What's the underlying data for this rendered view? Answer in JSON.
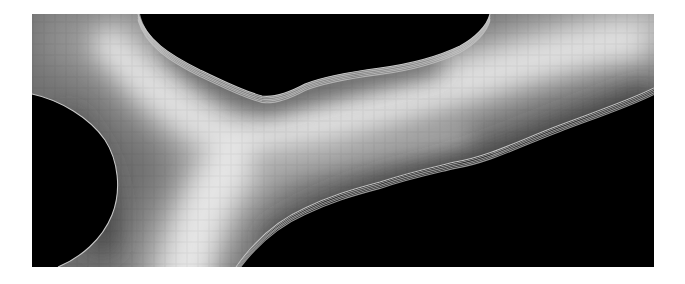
{
  "figure": {
    "background": "#ffffff",
    "panel": {
      "x": 32,
      "y": 14,
      "width": 622,
      "height": 253
    },
    "colors": {
      "dark_region": "#000000",
      "bright_core": "#dedede",
      "mid_gray": "#8a8a8a",
      "contour": "#c8c8c8"
    },
    "dark_regions": [
      {
        "name": "top-center-void",
        "path": "M140,14 C146,40 170,55 200,70 C222,80 240,90 262,96 C275,98 290,92 305,84 C325,76 350,72 380,68 C410,64 435,58 460,46 C475,38 487,26 490,14 Z"
      },
      {
        "name": "left-void",
        "path": "M32,94 C60,100 90,118 105,140 C118,160 122,190 112,215 C102,240 80,258 58,267 L32,267 Z"
      },
      {
        "name": "bottom-right-void",
        "path": "M236,267 C255,240 278,220 305,208 C330,196 350,190 380,182 C410,172 430,168 455,162 C490,156 520,140 560,125 C600,110 630,100 654,88 L654,267 Z"
      }
    ],
    "contours": [
      {
        "name": "top-center-contour",
        "count": 5,
        "path": "M138,14 C146,40 170,55 200,70 C222,80 240,90 262,96 C275,98 290,92 305,84 C325,76 350,72 380,68 C410,64 435,58 460,46 C475,38 487,26 490,14"
      },
      {
        "name": "left-contour",
        "count": 1,
        "path": "M32,94 C60,100 90,118 105,140 C118,160 122,190 112,215 C102,240 80,258 58,267"
      },
      {
        "name": "bottom-right-contour",
        "count": 5,
        "path": "M236,267 C255,240 278,220 305,208 C330,196 350,190 380,182 C410,172 430,168 455,162 C490,156 520,140 560,125 C600,110 630,100 654,88"
      }
    ],
    "pixel_size": 11
  }
}
